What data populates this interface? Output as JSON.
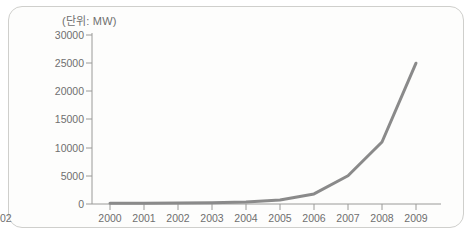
{
  "chart_data": {
    "type": "line",
    "title": "",
    "subtitle": "",
    "unit_label": "(단위: MW)",
    "xlabel": "",
    "ylabel": "",
    "categories": [
      "2000",
      "2001",
      "2002",
      "2003",
      "2004",
      "2005",
      "2006",
      "2007",
      "2008",
      "2009"
    ],
    "x": [
      2000,
      2001,
      2002,
      2003,
      2004,
      2005,
      2006,
      2007,
      2008,
      2009
    ],
    "values": [
      120,
      150,
      180,
      220,
      350,
      700,
      1800,
      5000,
      11000,
      25000
    ],
    "series": [
      {
        "name": "설비용량",
        "values": [
          120,
          150,
          180,
          220,
          350,
          700,
          1800,
          5000,
          11000,
          25000
        ]
      }
    ],
    "ylim": [
      0,
      30000
    ],
    "ytick_labels": [
      "30000",
      "25000",
      "20000",
      "15000",
      "10000",
      "5000",
      "0"
    ],
    "ytick_values": [
      30000,
      25000,
      20000,
      15000,
      10000,
      5000,
      0
    ],
    "grid": false,
    "legend": false,
    "legend_position": "none",
    "line_color": "#8a8a8a",
    "axis_color": "#9a9a98",
    "text_color": "#6f6f6f",
    "background_color": "#fdfdfc",
    "border_color": "#cfcfcc"
  }
}
